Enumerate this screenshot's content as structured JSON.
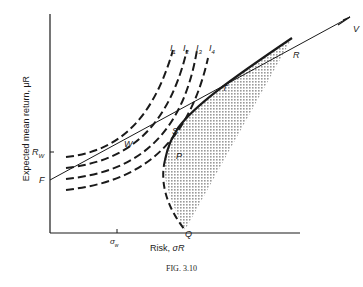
{
  "figure": {
    "caption": "FIG. 3.10",
    "y_axis_label": "Expected mean return, μR",
    "x_axis_label_text": "Risk, ",
    "x_axis_label_symbol": "σR",
    "y_tick_label": "R",
    "y_tick_sub": "W",
    "x_tick_label": "σ",
    "x_tick_sub": "w",
    "points": {
      "F": "F",
      "W": "W",
      "P": "P",
      "S": "S",
      "T": "T",
      "R": "R",
      "Q": "Q",
      "V": "V"
    },
    "indifference_curves": [
      {
        "label": "I",
        "sub": "1"
      },
      {
        "label": "I",
        "sub": "2"
      },
      {
        "label": "I",
        "sub": "3"
      },
      {
        "label": "I",
        "sub": "4"
      }
    ],
    "colors": {
      "ink": "#1a1a1a",
      "shade": "#b8b8b8"
    }
  }
}
